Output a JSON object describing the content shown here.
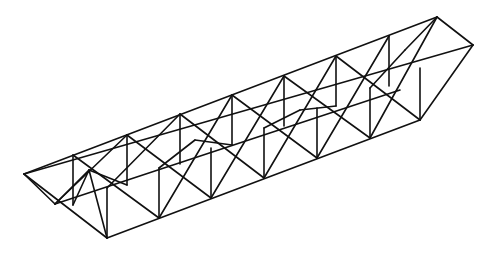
{
  "figure": {
    "stroke_color": "#111111",
    "background": "#ffffff",
    "bays": 8
  }
}
